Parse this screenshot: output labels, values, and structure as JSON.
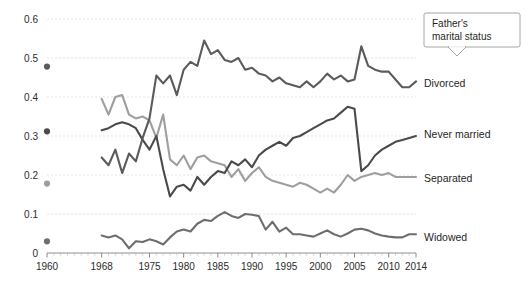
{
  "chart_data": {
    "type": "line",
    "title": "",
    "subtitle": "",
    "xlabel": "",
    "ylabel": "",
    "xlim": [
      1960,
      2014
    ],
    "ylim": [
      0,
      0.6
    ],
    "grid": true,
    "legend_position": "right-inline",
    "callout": {
      "line1": "Father's",
      "line2": "marital status"
    },
    "y_ticks": [
      "0",
      "0.1",
      "0.2",
      "0.3",
      "0.4",
      "0.5",
      "0.6"
    ],
    "y_tick_values": [
      0,
      0.1,
      0.2,
      0.3,
      0.4,
      0.5,
      0.6
    ],
    "x_ticks": [
      "1960",
      "1968",
      "1975",
      "1980",
      "1985",
      "1990",
      "1995",
      "2000",
      "2005",
      "2010",
      "2014"
    ],
    "x_tick_values": [
      1960,
      1968,
      1975,
      1980,
      1985,
      1990,
      1995,
      2000,
      2005,
      2010,
      2014
    ],
    "anchor_year": 1960,
    "series": [
      {
        "name": "Divorced",
        "label": "Divorced",
        "color": "#5b5b5b",
        "width": 2.1,
        "anchor_point": 0.478,
        "x": [
          1968,
          1969,
          1970,
          1971,
          1972,
          1973,
          1974,
          1975,
          1976,
          1977,
          1978,
          1979,
          1980,
          1981,
          1982,
          1983,
          1984,
          1985,
          1986,
          1987,
          1988,
          1989,
          1990,
          1991,
          1992,
          1993,
          1994,
          1995,
          1996,
          1997,
          1998,
          1999,
          2000,
          2001,
          2002,
          2003,
          2004,
          2005,
          2006,
          2007,
          2008,
          2009,
          2010,
          2011,
          2012,
          2013,
          2014
        ],
        "values": [
          0.245,
          0.225,
          0.265,
          0.205,
          0.255,
          0.235,
          0.295,
          0.345,
          0.455,
          0.435,
          0.455,
          0.405,
          0.47,
          0.49,
          0.48,
          0.545,
          0.51,
          0.52,
          0.495,
          0.49,
          0.5,
          0.47,
          0.475,
          0.46,
          0.455,
          0.44,
          0.45,
          0.435,
          0.43,
          0.425,
          0.44,
          0.425,
          0.44,
          0.46,
          0.445,
          0.455,
          0.44,
          0.445,
          0.53,
          0.48,
          0.47,
          0.465,
          0.465,
          0.445,
          0.425,
          0.425,
          0.44
        ]
      },
      {
        "name": "Never married",
        "label": "Never married",
        "color": "#4a4a4a",
        "width": 2.1,
        "anchor_point": 0.312,
        "x": [
          1968,
          1969,
          1970,
          1971,
          1972,
          1973,
          1974,
          1975,
          1976,
          1977,
          1978,
          1979,
          1980,
          1981,
          1982,
          1983,
          1984,
          1985,
          1986,
          1987,
          1988,
          1989,
          1990,
          1991,
          1992,
          1993,
          1994,
          1995,
          1996,
          1997,
          1998,
          1999,
          2000,
          2001,
          2002,
          2003,
          2004,
          2005,
          2006,
          2007,
          2008,
          2009,
          2010,
          2011,
          2012,
          2013,
          2014
        ],
        "values": [
          0.315,
          0.32,
          0.33,
          0.335,
          0.33,
          0.32,
          0.29,
          0.265,
          0.3,
          0.215,
          0.145,
          0.17,
          0.175,
          0.16,
          0.195,
          0.175,
          0.195,
          0.21,
          0.205,
          0.235,
          0.225,
          0.24,
          0.22,
          0.25,
          0.265,
          0.275,
          0.285,
          0.275,
          0.295,
          0.3,
          0.31,
          0.32,
          0.33,
          0.34,
          0.345,
          0.36,
          0.375,
          0.37,
          0.21,
          0.225,
          0.25,
          0.265,
          0.275,
          0.285,
          0.29,
          0.295,
          0.3
        ]
      },
      {
        "name": "Separated",
        "label": "Separated",
        "color": "#9e9e9e",
        "width": 2.1,
        "anchor_point": 0.178,
        "x": [
          1968,
          1969,
          1970,
          1971,
          1972,
          1973,
          1974,
          1975,
          1976,
          1977,
          1978,
          1979,
          1980,
          1981,
          1982,
          1983,
          1984,
          1985,
          1986,
          1987,
          1988,
          1989,
          1990,
          1991,
          1992,
          1993,
          1994,
          1995,
          1996,
          1997,
          1998,
          1999,
          2000,
          2001,
          2002,
          2003,
          2004,
          2005,
          2006,
          2007,
          2008,
          2009,
          2010,
          2011,
          2012,
          2013,
          2014
        ],
        "values": [
          0.395,
          0.355,
          0.4,
          0.405,
          0.355,
          0.345,
          0.35,
          0.34,
          0.295,
          0.355,
          0.24,
          0.225,
          0.25,
          0.215,
          0.245,
          0.25,
          0.235,
          0.23,
          0.225,
          0.195,
          0.215,
          0.185,
          0.205,
          0.22,
          0.195,
          0.185,
          0.18,
          0.175,
          0.17,
          0.18,
          0.175,
          0.165,
          0.155,
          0.165,
          0.155,
          0.175,
          0.2,
          0.185,
          0.195,
          0.2,
          0.205,
          0.2,
          0.205,
          0.195,
          0.195,
          0.195,
          0.195
        ]
      },
      {
        "name": "Widowed",
        "label": "Widowed",
        "color": "#6d6d6d",
        "width": 2.1,
        "anchor_point": 0.03,
        "x": [
          1968,
          1969,
          1970,
          1971,
          1972,
          1973,
          1974,
          1975,
          1976,
          1977,
          1978,
          1979,
          1980,
          1981,
          1982,
          1983,
          1984,
          1985,
          1986,
          1987,
          1988,
          1989,
          1990,
          1991,
          1992,
          1993,
          1994,
          1995,
          1996,
          1997,
          1998,
          1999,
          2000,
          2001,
          2002,
          2003,
          2004,
          2005,
          2006,
          2007,
          2008,
          2009,
          2010,
          2011,
          2012,
          2013,
          2014
        ],
        "values": [
          0.045,
          0.04,
          0.045,
          0.035,
          0.012,
          0.03,
          0.028,
          0.035,
          0.03,
          0.022,
          0.04,
          0.055,
          0.06,
          0.055,
          0.075,
          0.085,
          0.082,
          0.095,
          0.105,
          0.095,
          0.09,
          0.1,
          0.098,
          0.095,
          0.06,
          0.08,
          0.055,
          0.065,
          0.048,
          0.048,
          0.045,
          0.042,
          0.05,
          0.058,
          0.048,
          0.042,
          0.05,
          0.06,
          0.062,
          0.058,
          0.05,
          0.045,
          0.042,
          0.04,
          0.04,
          0.048,
          0.048
        ]
      }
    ]
  }
}
